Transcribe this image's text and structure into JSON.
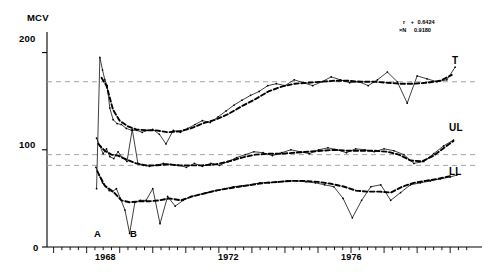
{
  "chart_data": {
    "type": "line",
    "title": "",
    "ylabel": "MCV",
    "xlabel": "",
    "ylim": [
      0,
      215
    ],
    "xlim": [
      1965.8,
      1978.6
    ],
    "grid": false,
    "legend_position": "right-inline",
    "y_ticks": [
      0,
      100,
      200
    ],
    "y_tick_labels": [
      "0",
      "100",
      "200"
    ],
    "x_ticks": [
      1968,
      1972,
      1976
    ],
    "x_tick_labels": [
      "1968",
      "1972",
      "1976"
    ],
    "x_minor_tick_interval": 0.25,
    "reference_lines": [
      {
        "name": "T-reference",
        "y": 170
      },
      {
        "name": "UL-reference",
        "y": 95
      },
      {
        "name": "LL-reference",
        "y": 84
      }
    ],
    "annotations": [
      {
        "name": "marker-A",
        "label": "A",
        "x": 1967.55,
        "y": 14
      },
      {
        "name": "marker-B",
        "label": "B",
        "x": 1968.45,
        "y": 14
      }
    ],
    "statistics": [
      {
        "name": "r",
        "symbol": "r",
        "sign": "+",
        "value": "0.6424"
      },
      {
        "name": "xN",
        "symbol": "×N",
        "sign": "",
        "value": "0.9180"
      }
    ],
    "series": [
      {
        "name": "T",
        "label": "T",
        "label_y": 178,
        "style": "raw",
        "x": [
          1967.3,
          1967.4,
          1967.48,
          1967.55,
          1967.62,
          1967.7,
          1967.8,
          1967.92,
          1968.05,
          1968.2,
          1968.36,
          1968.52,
          1968.68,
          1968.84,
          1969.0,
          1969.2,
          1969.4,
          1969.62,
          1969.84,
          1970.06,
          1970.28,
          1970.5,
          1970.74,
          1970.98,
          1971.22,
          1971.46,
          1971.7,
          1971.96,
          1972.22,
          1972.48,
          1972.74,
          1973.0,
          1973.28,
          1973.56,
          1973.84,
          1974.12,
          1974.4,
          1974.68,
          1974.96,
          1975.24,
          1975.52,
          1975.8,
          1976.1,
          1976.4,
          1976.7,
          1977.0,
          1977.3,
          1977.6,
          1977.9,
          1978.15
        ],
        "values": [
          60,
          195,
          182,
          172,
          166,
          143,
          131,
          127,
          126,
          122,
          120,
          120,
          118,
          120,
          121,
          116,
          106,
          120,
          118,
          122,
          126,
          130,
          128,
          134,
          140,
          146,
          151,
          156,
          160,
          166,
          168,
          166,
          172,
          169,
          166,
          170,
          175,
          172,
          169,
          170,
          166,
          172,
          180,
          170,
          148,
          176,
          173,
          170,
          172,
          185
        ]
      },
      {
        "name": "T-smooth",
        "label": "T",
        "style": "smoothed",
        "x": [
          1967.45,
          1967.6,
          1967.8,
          1968.0,
          1968.25,
          1968.5,
          1968.8,
          1969.1,
          1969.45,
          1969.8,
          1970.15,
          1970.5,
          1970.9,
          1971.3,
          1971.7,
          1972.1,
          1972.5,
          1972.9,
          1973.3,
          1973.7,
          1974.1,
          1974.5,
          1974.9,
          1975.3,
          1975.7,
          1976.1,
          1976.5,
          1976.9,
          1977.3,
          1977.7,
          1978.05
        ],
        "values": [
          174,
          166,
          141,
          130,
          124,
          121,
          120,
          120,
          118,
          119,
          122,
          127,
          131,
          137,
          145,
          152,
          160,
          165,
          168,
          169,
          170,
          171,
          171,
          170,
          170,
          169,
          168,
          168,
          169,
          171,
          177
        ]
      },
      {
        "name": "UL",
        "label": "UL",
        "label_y": 112,
        "style": "raw",
        "x": [
          1967.3,
          1967.4,
          1967.5,
          1967.6,
          1967.7,
          1967.82,
          1967.95,
          1968.08,
          1968.22,
          1968.38,
          1968.55,
          1968.72,
          1968.9,
          1969.1,
          1969.32,
          1969.55,
          1969.78,
          1970.02,
          1970.26,
          1970.5,
          1970.76,
          1971.02,
          1971.28,
          1971.54,
          1971.8,
          1972.06,
          1972.34,
          1972.62,
          1972.9,
          1973.18,
          1973.46,
          1973.74,
          1974.02,
          1974.3,
          1974.58,
          1974.86,
          1975.14,
          1975.42,
          1975.7,
          1976.0,
          1976.3,
          1976.6,
          1976.9,
          1977.2,
          1977.5,
          1977.8,
          1978.1
        ],
        "values": [
          112,
          104,
          96,
          101,
          93,
          91,
          98,
          92,
          88,
          121,
          86,
          84,
          83,
          84,
          86,
          85,
          84,
          82,
          86,
          83,
          86,
          84,
          88,
          92,
          95,
          98,
          97,
          94,
          97,
          100,
          98,
          96,
          100,
          102,
          100,
          97,
          101,
          100,
          98,
          101,
          99,
          95,
          86,
          88,
          96,
          104,
          110
        ]
      },
      {
        "name": "UL-smooth",
        "label": "UL",
        "style": "smoothed",
        "x": [
          1967.35,
          1967.55,
          1967.75,
          1967.95,
          1968.2,
          1968.5,
          1968.8,
          1969.1,
          1969.45,
          1969.8,
          1970.15,
          1970.5,
          1970.9,
          1971.3,
          1971.7,
          1972.1,
          1972.5,
          1972.9,
          1973.3,
          1973.7,
          1974.1,
          1974.5,
          1974.9,
          1975.3,
          1975.7,
          1976.1,
          1976.45,
          1976.8,
          1977.15,
          1977.5,
          1977.85,
          1978.1
        ],
        "values": [
          106,
          99,
          95,
          94,
          90,
          86,
          84,
          84,
          85,
          84,
          84,
          84,
          85,
          88,
          92,
          95,
          96,
          96,
          97,
          98,
          99,
          100,
          99,
          99,
          99,
          98,
          95,
          89,
          88,
          94,
          103,
          109
        ]
      },
      {
        "name": "LL",
        "label": "LL",
        "label_y": 76,
        "style": "raw",
        "x": [
          1967.28,
          1967.38,
          1967.48,
          1967.58,
          1967.68,
          1967.78,
          1967.9,
          1968.02,
          1968.16,
          1968.3,
          1968.46,
          1968.62,
          1968.8,
          1969.0,
          1969.22,
          1969.45,
          1969.68,
          1969.92,
          1970.16,
          1970.4,
          1970.66,
          1970.92,
          1971.18,
          1971.44,
          1971.7,
          1971.96,
          1972.24,
          1972.52,
          1972.8,
          1973.08,
          1973.36,
          1973.64,
          1973.92,
          1974.2,
          1974.48,
          1974.76,
          1975.04,
          1975.32,
          1975.6,
          1975.9,
          1976.2,
          1976.5,
          1976.8,
          1977.1,
          1977.4,
          1977.7,
          1978.0,
          1978.2
        ],
        "values": [
          82,
          74,
          66,
          62,
          58,
          57,
          60,
          50,
          38,
          14,
          46,
          48,
          48,
          60,
          24,
          52,
          42,
          48,
          52,
          54,
          56,
          58,
          60,
          62,
          63,
          64,
          66,
          66,
          67,
          68,
          68,
          67,
          66,
          64,
          62,
          50,
          30,
          48,
          62,
          64,
          48,
          56,
          64,
          66,
          68,
          70,
          72,
          74
        ]
      },
      {
        "name": "LL-smooth",
        "label": "LL",
        "style": "smoothed",
        "x": [
          1967.32,
          1967.55,
          1967.8,
          1968.05,
          1968.3,
          1968.6,
          1968.9,
          1969.2,
          1969.5,
          1969.85,
          1970.2,
          1970.55,
          1970.9,
          1971.25,
          1971.6,
          1972.0,
          1972.4,
          1972.8,
          1973.2,
          1973.6,
          1974.0,
          1974.4,
          1974.8,
          1975.15,
          1975.5,
          1975.85,
          1976.2,
          1976.55,
          1976.9,
          1977.25,
          1977.6,
          1978.0
        ],
        "values": [
          78,
          63,
          57,
          48,
          46,
          47,
          47,
          48,
          50,
          48,
          52,
          55,
          58,
          60,
          62,
          64,
          66,
          67,
          68,
          68,
          67,
          65,
          62,
          58,
          57,
          57,
          56,
          62,
          66,
          68,
          70,
          73
        ]
      }
    ]
  }
}
